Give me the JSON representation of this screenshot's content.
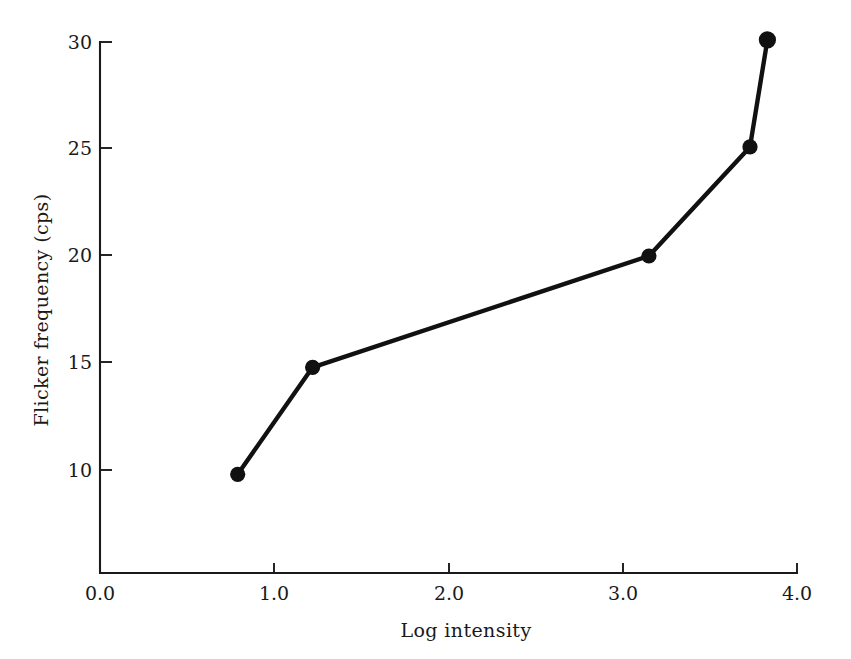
{
  "figure": {
    "background_color": "#ffffff",
    "ink_color": "#111111"
  },
  "axes": {
    "x": {
      "title": "Log intensity",
      "tick_labels": [
        "0.0",
        "1.0",
        "2.0",
        "3.0",
        "4.0"
      ],
      "tick_values": [
        0.0,
        1.0,
        2.0,
        3.0,
        4.0
      ],
      "range": [
        0.0,
        4.0
      ]
    },
    "y": {
      "title": "Flicker frequency (cps)",
      "tick_labels": [
        "10",
        "15",
        "20",
        "25",
        "30"
      ],
      "tick_values": [
        10,
        15,
        20,
        25,
        30
      ],
      "range": [
        5.2,
        30.0
      ]
    }
  },
  "chart_data": {
    "type": "line",
    "title": "",
    "subtitle": "",
    "xlabel": "Log intensity",
    "ylabel": "Flicker frequency (cps)",
    "xlim": [
      0.0,
      4.0
    ],
    "ylim": [
      5.2,
      30.0
    ],
    "xticks": [
      0.0,
      1.0,
      2.0,
      3.0,
      4.0
    ],
    "yticks": [
      10,
      15,
      20,
      25,
      30
    ],
    "grid": false,
    "legend": false,
    "legend_position": "none",
    "marker": "filled-circle",
    "series": [
      {
        "name": "Flicker frequency",
        "x": [
          0.79,
          1.22,
          3.15,
          3.73,
          3.83
        ],
        "y": [
          9.8,
          14.8,
          20.0,
          25.1,
          30.1
        ],
        "color": "#111111"
      }
    ],
    "annotations": []
  },
  "labels": {
    "x_tick_0": "0.0",
    "x_tick_1": "1.0",
    "x_tick_2": "2.0",
    "x_tick_3": "3.0",
    "x_tick_4": "4.0",
    "y_tick_0": "10",
    "y_tick_1": "15",
    "y_tick_2": "20",
    "y_tick_3": "25",
    "y_tick_4": "30",
    "x_axis_title": "Log intensity",
    "y_axis_title": "Flicker frequency (cps)"
  }
}
